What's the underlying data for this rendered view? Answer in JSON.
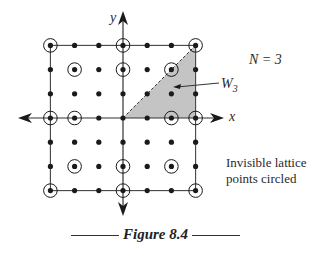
{
  "figure": {
    "caption": "Figure 8.4",
    "n_label": "N = 3",
    "region_label": "W",
    "region_subscript": "3",
    "x_axis_label": "x",
    "y_axis_label": "y",
    "note_line1": "Invisible lattice",
    "note_line2": "points circled",
    "colors": {
      "shade": "#c4c4c4",
      "ink": "#1a1a1a"
    }
  },
  "chart_data": {
    "type": "scatter",
    "title": "Figure 8.4",
    "xlabel": "x",
    "ylabel": "y",
    "xlim": [
      -3,
      3
    ],
    "ylim": [
      -3,
      3
    ],
    "N": 3,
    "lattice_points": "all integer (x,y) with -3<=x<=3, -3<=y<=3",
    "circled_invisible_points": [
      [
        -3,
        3
      ],
      [
        0,
        3
      ],
      [
        3,
        3
      ],
      [
        -2,
        2
      ],
      [
        0,
        2
      ],
      [
        2,
        2
      ],
      [
        -3,
        0
      ],
      [
        -2,
        0
      ],
      [
        2,
        0
      ],
      [
        3,
        0
      ],
      [
        -2,
        -2
      ],
      [
        0,
        -2
      ],
      [
        2,
        -2
      ],
      [
        -3,
        -3
      ],
      [
        0,
        -3
      ],
      [
        3,
        -3
      ]
    ],
    "shaded_region": {
      "name": "W3",
      "vertices": [
        [
          0,
          0
        ],
        [
          3,
          0
        ],
        [
          3,
          3
        ]
      ]
    },
    "annotations": [
      "N = 3",
      "W3",
      "Invisible lattice points circled"
    ]
  }
}
